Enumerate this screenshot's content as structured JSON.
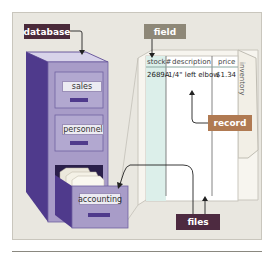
{
  "diagram": {
    "labels": {
      "database": "database",
      "field": "field",
      "record": "record",
      "files": "files"
    },
    "drawers": [
      {
        "label": "sales"
      },
      {
        "label": "personnel"
      },
      {
        "label": "accounting"
      }
    ],
    "file_sheet": {
      "tab_label": "inventory",
      "columns": [
        "stock#",
        "description",
        "price"
      ],
      "rows": [
        [
          "2689A",
          "1/4\" left elbow",
          "$1.34"
        ]
      ]
    },
    "colors": {
      "panel_bg": "#e9e7e0",
      "cabinet_side": "#4f3a8c",
      "cabinet_front": "#a89cc8",
      "cabinet_top": "#d8d3ea",
      "database_tag": "#4a2a3a",
      "field_tag": "#8e8878",
      "record_tag": "#b07a52",
      "files_tag": "#4d2a40",
      "stock_column": "#dcefea"
    }
  }
}
